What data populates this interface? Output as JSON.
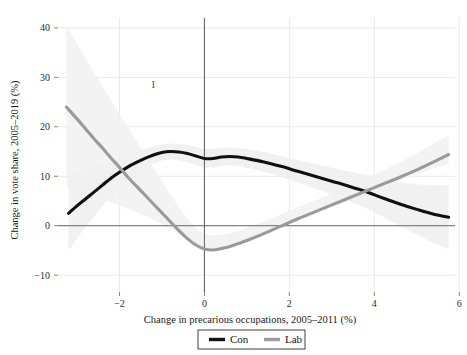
{
  "chart_data": {
    "type": "line",
    "title": "",
    "xlabel": "Change in precarious occupations, 2005–2011 (%)",
    "ylabel": "Change in vote share, 2005–2019 (%)",
    "xlim": [
      -3.4,
      5.9
    ],
    "ylim": [
      -13,
      42
    ],
    "xticks": [
      -2,
      0,
      2,
      4,
      6
    ],
    "xtick_labels": [
      "−2",
      "0",
      "2",
      "4",
      "6"
    ],
    "yticks": [
      -10,
      0,
      10,
      20,
      30,
      40
    ],
    "ytick_labels": [
      "−10",
      "0",
      "10",
      "20",
      "30",
      "40"
    ],
    "grid": true,
    "grid_color": "#e9e9e9",
    "legend_position": "bottom-center",
    "reference_lines": [
      {
        "name": "zero-horizontal",
        "orientation": "horizontal",
        "value": 0,
        "color": "#5a5a5a"
      },
      {
        "name": "zero-vertical",
        "orientation": "vertical",
        "value": 0,
        "color": "#4a4a4a"
      }
    ],
    "annotations": [
      {
        "name": "tick-mark-annotation",
        "text": "I",
        "x": -1.2,
        "y": 27.8
      }
    ],
    "series": [
      {
        "name": "Con",
        "color": "#101010",
        "band_color": "#eeeeee",
        "x": [
          -3.2,
          -3.0,
          -2.8,
          -2.6,
          -2.4,
          -2.2,
          -2.0,
          -1.8,
          -1.6,
          -1.4,
          -1.2,
          -1.0,
          -0.8,
          -0.6,
          -0.4,
          -0.2,
          0.0,
          0.2,
          0.4,
          0.6,
          0.8,
          1.0,
          1.4,
          1.8,
          2.2,
          2.6,
          3.0,
          3.4,
          3.8,
          4.2,
          4.6,
          5.0,
          5.4,
          5.75
        ],
        "values": [
          2.5,
          4.0,
          5.4,
          6.8,
          8.2,
          9.6,
          10.8,
          11.9,
          12.8,
          13.6,
          14.3,
          14.8,
          15.0,
          14.9,
          14.6,
          14.1,
          13.6,
          13.6,
          13.9,
          14.0,
          13.9,
          13.6,
          12.9,
          12.0,
          11.0,
          10.0,
          9.0,
          8.0,
          6.9,
          5.6,
          4.4,
          3.3,
          2.3,
          1.7
        ],
        "band_upper": [
          10.0,
          10.6,
          11.1,
          11.8,
          12.4,
          13.1,
          13.7,
          14.3,
          14.9,
          15.5,
          16.0,
          16.4,
          16.6,
          16.5,
          16.3,
          15.9,
          15.5,
          15.5,
          15.7,
          15.8,
          15.7,
          15.5,
          14.9,
          14.1,
          13.3,
          12.5,
          11.7,
          11.0,
          10.2,
          9.4,
          8.8,
          8.4,
          8.2,
          8.2
        ],
        "band_lower": [
          -5.0,
          -2.6,
          -0.3,
          1.8,
          4.0,
          6.1,
          7.9,
          9.5,
          10.7,
          11.7,
          12.6,
          13.2,
          13.4,
          13.3,
          12.9,
          12.3,
          11.7,
          11.7,
          12.1,
          12.2,
          12.1,
          11.7,
          10.9,
          9.9,
          8.7,
          7.5,
          6.3,
          5.0,
          3.6,
          1.8,
          0.0,
          -1.8,
          -3.6,
          -4.8
        ]
      },
      {
        "name": "Lab",
        "color": "#9a9a9a",
        "band_color": "#f1f1f1",
        "x": [
          -3.25,
          -3.0,
          -2.8,
          -2.6,
          -2.4,
          -2.2,
          -2.0,
          -1.8,
          -1.6,
          -1.4,
          -1.2,
          -1.0,
          -0.8,
          -0.6,
          -0.4,
          -0.2,
          0.0,
          0.2,
          0.4,
          0.6,
          0.8,
          1.0,
          1.4,
          1.8,
          2.2,
          2.6,
          3.0,
          3.4,
          3.8,
          4.2,
          4.6,
          5.0,
          5.4,
          5.75
        ],
        "values": [
          24.0,
          21.6,
          19.6,
          17.6,
          15.7,
          13.7,
          11.8,
          9.8,
          8.0,
          6.2,
          4.4,
          2.6,
          0.8,
          -1.0,
          -2.6,
          -3.9,
          -4.7,
          -4.9,
          -4.6,
          -4.2,
          -3.6,
          -3.0,
          -1.6,
          -0.1,
          1.4,
          2.8,
          4.2,
          5.6,
          7.0,
          8.4,
          9.8,
          11.3,
          12.9,
          14.4
        ],
        "band_upper": [
          40.5,
          36.8,
          33.9,
          31.0,
          28.2,
          25.4,
          22.6,
          19.8,
          17.1,
          14.4,
          11.7,
          9.0,
          6.4,
          3.8,
          1.4,
          -0.5,
          -1.7,
          -2.0,
          -1.8,
          -1.5,
          -1.0,
          -0.4,
          0.9,
          2.3,
          3.7,
          5.1,
          6.5,
          8.0,
          9.5,
          11.1,
          12.8,
          14.6,
          16.6,
          18.4
        ],
        "band_lower": [
          8.0,
          7.2,
          6.6,
          5.9,
          5.3,
          4.7,
          4.1,
          3.4,
          2.7,
          2.0,
          1.2,
          0.3,
          -0.6,
          -1.6,
          -2.6,
          -3.6,
          -4.4,
          -4.7,
          -4.6,
          -4.2,
          -3.7,
          -3.1,
          -1.8,
          -0.4,
          1.0,
          2.4,
          3.8,
          5.1,
          6.5,
          7.8,
          9.1,
          10.4,
          11.6,
          12.6
        ]
      }
    ],
    "legend": [
      {
        "label": "Con",
        "color": "#101010"
      },
      {
        "label": "Lab",
        "color": "#9a9a9a"
      }
    ]
  }
}
